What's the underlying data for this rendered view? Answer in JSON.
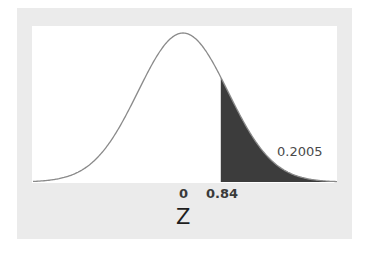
{
  "chart_data": {
    "type": "area",
    "title": "",
    "xlabel": "Z",
    "ylabel": "",
    "xticks": [
      "0",
      "0.84"
    ],
    "mean": 0,
    "sd": 1,
    "shaded_region": {
      "from": 0.84,
      "to": "infinity",
      "area": 0.2005
    },
    "annotations": [
      {
        "text": "0.2005",
        "position": "right of shaded tail"
      }
    ],
    "grid": false,
    "legend": null,
    "colors": {
      "curve": "#8a8a8a",
      "shade": "#3c3c3c",
      "panel": "#ebebeb",
      "plot": "#ffffff"
    }
  },
  "labels": {
    "tick_zero": "0",
    "tick_z": "0.84",
    "xlabel": "Z",
    "area": "0.2005"
  }
}
